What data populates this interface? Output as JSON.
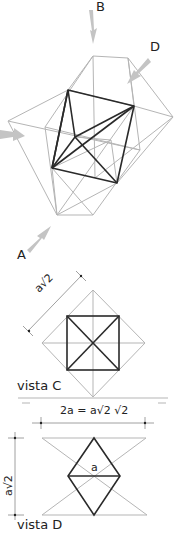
{
  "colors": {
    "dark_line": "#2a2a2a",
    "light_line": "#b5b5b5",
    "arrow": "#c4c4c4",
    "text": "#222222"
  },
  "view_arrows": {
    "A": "A",
    "B": "B",
    "D": "D"
  },
  "vista_c": {
    "label": "vista C",
    "dimension": "a√2"
  },
  "vista_d": {
    "label": "vista D",
    "width_formula": "2a = a√2 √2",
    "height_dimension": "a√2",
    "edge_label": "a"
  }
}
